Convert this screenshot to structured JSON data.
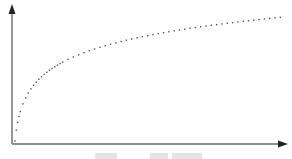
{
  "chart_data": {
    "type": "scatter",
    "title": "",
    "xlabel": "",
    "ylabel": "",
    "grid": false,
    "legend": null,
    "xlim": [
      0,
      100
    ],
    "ylim": [
      0,
      100
    ],
    "axis_ticks": false,
    "model": "y = 21.7 * ln(1 + x)",
    "x": [
      0,
      0.5,
      1,
      1.5,
      2,
      3,
      4,
      5,
      6,
      7,
      8,
      9,
      10,
      11,
      12,
      13,
      14,
      15,
      16,
      17,
      18,
      20,
      22,
      24,
      26,
      28,
      30,
      32,
      34,
      36,
      38,
      40,
      42,
      44,
      46,
      48,
      50,
      52,
      54,
      56,
      58,
      60,
      62,
      64,
      66,
      68,
      70,
      72,
      74,
      76,
      78,
      80,
      82,
      84,
      86,
      88,
      90,
      92,
      94,
      96,
      98,
      100
    ],
    "series_color": "#555555",
    "axis_color": "#333333"
  },
  "caption": {
    "text": "",
    "note": "caption clipped at bottom edge, not legible"
  }
}
